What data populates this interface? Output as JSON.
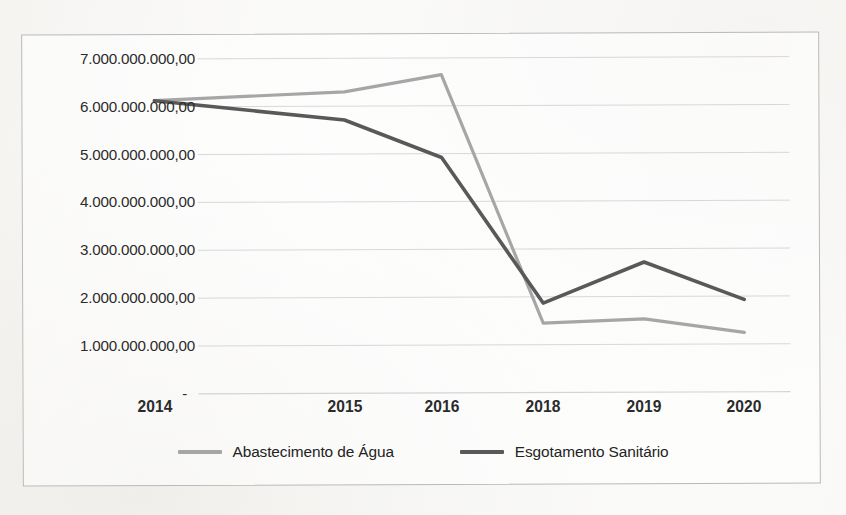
{
  "chart_data": {
    "type": "line",
    "title": "",
    "subtitle": "",
    "xlabel": "",
    "ylabel": "",
    "categories": [
      "2014",
      "2015",
      "2016",
      "2018",
      "2019",
      "2020"
    ],
    "ytick_labels": [
      "7.000.000.000,00",
      "6.000.000.000,00",
      "5.000.000.000,00",
      "4.000.000.000,00",
      "3.000.000.000,00",
      "2.000.000.000,00",
      "1.000.000.000,00",
      "-"
    ],
    "ytick_values": [
      7000000000,
      6000000000,
      5000000000,
      4000000000,
      3000000000,
      2000000000,
      1000000000,
      0
    ],
    "ylim": [
      0,
      7000000000
    ],
    "grid": true,
    "grid_axis": "y",
    "legend_position": "bottom",
    "series": [
      {
        "name": "Abastecimento de Água",
        "color": "#a6a6a6",
        "values": [
          6130000000,
          6300000000,
          6650000000,
          1450000000,
          1530000000,
          1240000000
        ]
      },
      {
        "name": "Esgotamento Sanitário",
        "color": "#595959",
        "values": [
          6130000000,
          5710000000,
          4920000000,
          1870000000,
          2720000000,
          1930000000
        ]
      }
    ]
  },
  "legend": {
    "items": [
      {
        "label": "Abastecimento de Água",
        "swatch_color": "#a6a6a6"
      },
      {
        "label": "Esgotamento Sanitário",
        "swatch_color": "#595959"
      }
    ]
  },
  "style": {
    "gridline_color": "#d4d4d4",
    "frame_color": "#b9b9b9",
    "text_color": "#2b2b2b",
    "background": "#fdfdfc"
  }
}
